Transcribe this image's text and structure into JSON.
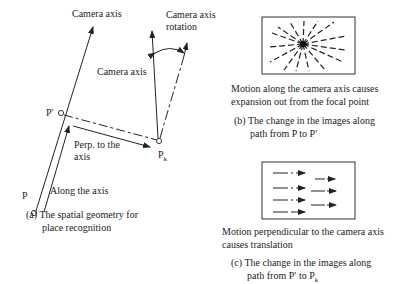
{
  "panel_a": {
    "top_axis_label": "Camera axis",
    "mid_axis_label": "Camera axis",
    "rotation_label_1": "Camera axis",
    "rotation_label_2": "rotation",
    "point_p": "P",
    "point_p_prime": "P′",
    "point_pk": "P",
    "point_pk_sub": "k",
    "perp_label_1": "Perp. to the",
    "perp_label_2": "axis",
    "along_label": "Along the axis",
    "caption_1": "(a) The spatial geometry for",
    "caption_2": "place recognition"
  },
  "panel_b": {
    "desc_1": "Motion along the camera axis causes",
    "desc_2": "expansion out from the focal point",
    "caption_1": "(b) The change in the images along",
    "caption_2": "path from P to P′"
  },
  "panel_c": {
    "desc_1": "Motion perpendicular to the camera axis",
    "desc_2": "causes translation",
    "caption_1": "(c) The change in the images along",
    "caption_2": "path from P′ to P",
    "caption_2_sub": "k"
  }
}
